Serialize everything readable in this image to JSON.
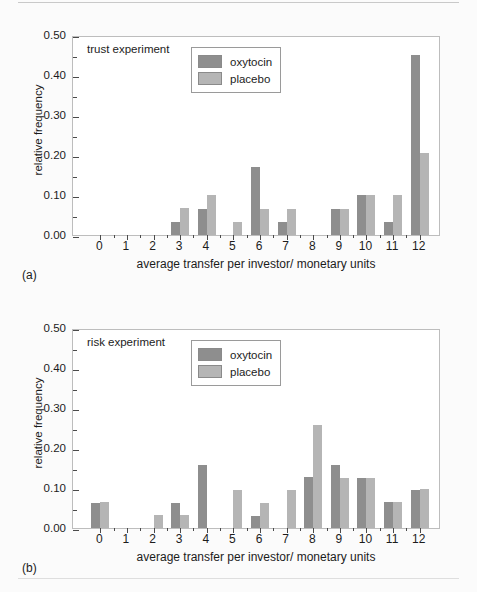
{
  "figure": {
    "panel_a_tag": "(a)",
    "panel_b_tag": "(b)"
  },
  "legend": {
    "oxytocin_label": "oxytocin",
    "placebo_label": "placebo",
    "oxytocin_color": "#8e8e8e",
    "placebo_color": "#b5b5b5"
  },
  "chart_data": [
    {
      "type": "bar",
      "title": "trust experiment",
      "xlabel": "average transfer per investor/ monetary units",
      "ylabel": "relative frequency",
      "categories": [
        "0",
        "1",
        "2",
        "3",
        "4",
        "5",
        "6",
        "7",
        "8",
        "9",
        "10",
        "11",
        "12"
      ],
      "ylim": [
        0.0,
        0.5
      ],
      "yticks": [
        "0.00",
        "0.10",
        "0.20",
        "0.30",
        "0.40",
        "0.50"
      ],
      "ytick_values": [
        0.0,
        0.1,
        0.2,
        0.3,
        0.4,
        0.5
      ],
      "yminor_step": 0.05,
      "grid": false,
      "legend_position": "top-right",
      "series": [
        {
          "name": "oxytocin",
          "color": "#8e8e8e",
          "values": [
            0,
            0,
            0,
            0.033,
            0.065,
            0,
            0.17,
            0.033,
            0,
            0.065,
            0.1,
            0.033,
            0.45
          ]
        },
        {
          "name": "placebo",
          "color": "#b5b5b5",
          "values": [
            0,
            0,
            0,
            0.068,
            0.1,
            0.033,
            0.065,
            0.065,
            0,
            0.065,
            0.1,
            0.1,
            0.205
          ]
        }
      ]
    },
    {
      "type": "bar",
      "title": "risk experiment",
      "xlabel": "average transfer per investor/ monetary units",
      "ylabel": "relative frequency",
      "categories": [
        "0",
        "1",
        "2",
        "3",
        "4",
        "5",
        "6",
        "7",
        "8",
        "9",
        "10",
        "11",
        "12"
      ],
      "ylim": [
        0.0,
        0.5
      ],
      "yticks": [
        "0.00",
        "0.10",
        "0.20",
        "0.30",
        "0.40",
        "0.50"
      ],
      "ytick_values": [
        0.0,
        0.1,
        0.2,
        0.3,
        0.4,
        0.5
      ],
      "yminor_step": 0.05,
      "grid": false,
      "legend_position": "top-right",
      "series": [
        {
          "name": "oxytocin",
          "color": "#8e8e8e",
          "values": [
            0.062,
            0,
            0,
            0.062,
            0.157,
            0,
            0.03,
            0,
            0.128,
            0.158,
            0.125,
            0.065,
            0.095
          ]
        },
        {
          "name": "placebo",
          "color": "#b5b5b5",
          "values": [
            0.065,
            0,
            0.032,
            0.032,
            0,
            0.095,
            0.062,
            0.095,
            0.258,
            0.125,
            0.125,
            0.065,
            0.098
          ]
        }
      ]
    }
  ]
}
